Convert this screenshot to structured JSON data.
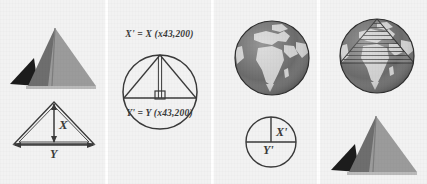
{
  "figure": {
    "background_color": "#f2f2f2",
    "panel_count": 4
  },
  "panels": [
    {
      "id": "panel-pyramid-dimensions",
      "caption": "",
      "shapes": [
        "pyramid-photo",
        "triangle-diagram"
      ],
      "labels": {
        "height": "X",
        "base": "Y"
      },
      "colors": {
        "pyramid_light_face": "#9b9b9b",
        "pyramid_dark_face": "#6e6e6e",
        "pyramid_shadow": "#1c1c1c",
        "line": "#3a3a3a"
      }
    },
    {
      "id": "panel-scaled-circle",
      "caption_top": "X' = X (x43,200)",
      "caption_bottom": "Y' = Y (x43,200)",
      "shapes": [
        "circle",
        "inscribed-triangle",
        "height-line",
        "right-angle-marker"
      ],
      "colors": {
        "line": "#3a3a3a"
      }
    },
    {
      "id": "panel-globe-reference",
      "caption": "",
      "shapes": [
        "earth-globe",
        "quarter-circle-diagram"
      ],
      "labels": {
        "height": "X'",
        "base": "Y'"
      },
      "colors": {
        "ocean": "#6b6b6b",
        "land": "#cfcfcf",
        "line": "#3a3a3a"
      }
    },
    {
      "id": "panel-globe-with-pyramid",
      "caption": "",
      "shapes": [
        "earth-globe-with-hatched-triangle",
        "pyramid-photo"
      ],
      "colors": {
        "ocean": "#6b6b6b",
        "land": "#cfcfcf",
        "hatch": "#3a3a3a",
        "pyramid_light_face": "#9b9b9b",
        "pyramid_dark_face": "#6e6e6e",
        "pyramid_shadow": "#1c1c1c"
      }
    }
  ]
}
